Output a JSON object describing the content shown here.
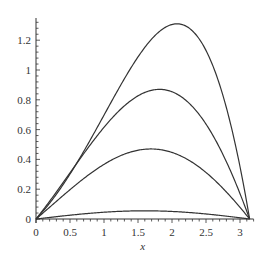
{
  "chart_data": {
    "type": "line",
    "title": "",
    "xlabel": "x",
    "ylabel": "",
    "xlim": [
      0,
      3.1416
    ],
    "ylim": [
      0,
      1.32
    ],
    "grid": false,
    "legend": null,
    "x_ticks": [
      "0",
      "0.5",
      "1",
      "1.5",
      "2",
      "2.5",
      "3"
    ],
    "y_ticks": [
      "0",
      "0.2",
      "0.4",
      "0.6",
      "0.8",
      "1",
      "1.2"
    ],
    "series": [
      {
        "name": "curve-1",
        "peak_x": 1.9,
        "peak_y": 1.31,
        "skew": 0.55,
        "x": [
          0,
          0.5,
          1.0,
          1.5,
          1.9,
          2.5,
          3.0,
          3.1416
        ],
        "values": [
          0,
          0.48,
          0.95,
          1.25,
          1.31,
          0.98,
          0.25,
          0
        ]
      },
      {
        "name": "curve-2",
        "peak_x": 1.72,
        "peak_y": 0.87,
        "skew": 0.25,
        "x": [
          0,
          0.5,
          1.0,
          1.5,
          1.72,
          2.5,
          3.0,
          3.1416
        ],
        "values": [
          0,
          0.38,
          0.7,
          0.86,
          0.87,
          0.58,
          0.14,
          0
        ]
      },
      {
        "name": "curve-3",
        "peak_x": 1.65,
        "peak_y": 0.47,
        "skew": 0.12,
        "x": [
          0,
          0.5,
          1.0,
          1.5,
          1.65,
          2.5,
          3.0,
          3.1416
        ],
        "values": [
          0,
          0.22,
          0.39,
          0.47,
          0.47,
          0.31,
          0.07,
          0
        ]
      },
      {
        "name": "curve-4",
        "peak_x": 1.6,
        "peak_y": 0.055,
        "skew": 0.03,
        "x": [
          0,
          0.5,
          1.0,
          1.5,
          1.6,
          2.5,
          3.0,
          3.1416
        ],
        "values": [
          0,
          0.026,
          0.046,
          0.055,
          0.055,
          0.034,
          0.008,
          0
        ]
      }
    ],
    "line_color": "#333333"
  }
}
